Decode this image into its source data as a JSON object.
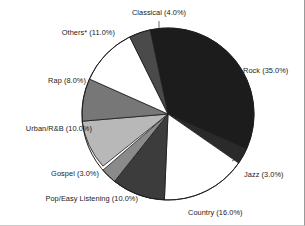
{
  "chart_data": {
    "type": "pie",
    "title": "",
    "xlabel": "",
    "ylabel": "",
    "legend_position": "none",
    "labels_on_slices": false,
    "label_format": "{name} ({value}%)",
    "start_angle_deg": -12,
    "direction": "clockwise",
    "categories": [
      "Rock",
      "Jazz",
      "Country",
      "Pop/Easy Listening",
      "Gospel",
      "Urban/R&B",
      "Rap",
      "Others*",
      "Classical"
    ],
    "values": [
      35.0,
      3.0,
      16.0,
      10.0,
      3.0,
      10.0,
      8.0,
      11.0,
      4.0
    ],
    "total": 100.0,
    "colors": [
      "#1c1c1c",
      "#2a2a2a",
      "#ffffff",
      "#3c3c3c",
      "#8a8a8a",
      "#b8b8b8",
      "#777777",
      "#ffffff",
      "#4a4a4a"
    ],
    "slices": [
      {
        "name": "Rock",
        "value": 35.0,
        "label": "Rock (35.0%)",
        "color": "#1c1c1c"
      },
      {
        "name": "Jazz",
        "value": 3.0,
        "label": "Jazz (3.0%)",
        "color": "#2a2a2a"
      },
      {
        "name": "Country",
        "value": 16.0,
        "label": "Country (16.0%)",
        "color": "#ffffff"
      },
      {
        "name": "Pop/Easy Listening",
        "value": 10.0,
        "label": "Pop/Easy Listening (10.0%)",
        "color": "#3c3c3c"
      },
      {
        "name": "Gospel",
        "value": 3.0,
        "label": "Gospel (3.0%)",
        "color": "#8a8a8a"
      },
      {
        "name": "Urban/R&B",
        "value": 10.0,
        "label": "Urban/R&B (10.0%)",
        "color": "#b8b8b8"
      },
      {
        "name": "Rap",
        "value": 8.0,
        "label": "Rap (8.0%)",
        "color": "#777777"
      },
      {
        "name": "Others*",
        "value": 11.0,
        "label": "Others* (11.0%)",
        "color": "#ffffff"
      },
      {
        "name": "Classical",
        "value": 4.0,
        "label": "Classical (4.0%)",
        "color": "#4a4a4a"
      }
    ]
  },
  "labels": {
    "classical": "Classical (4.0%)",
    "others": "Others* (11.0%)",
    "rap": "Rap (8.0%)",
    "urban_rnb": "Urban/R&B (10.0%)",
    "gospel": "Gospel (3.0%)",
    "pop_easy": "Pop/Easy Listening (10.0%)",
    "country": "Country (16.0%)",
    "jazz": "Jazz (3.0%)",
    "rock": "Rock (35.0%)"
  },
  "geometry": {
    "center_x": 168,
    "center_y": 114,
    "radius": 86
  }
}
